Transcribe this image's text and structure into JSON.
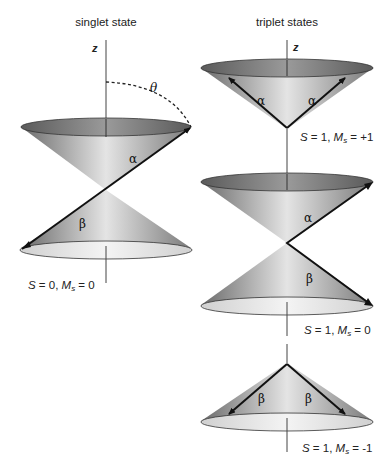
{
  "titles": {
    "singlet": "singlet state",
    "triplet": "triplet states"
  },
  "axis_label": "z",
  "angle_label": "θ",
  "spin_labels": {
    "alpha": "α",
    "beta": "β"
  },
  "states": [
    {
      "name": "singlet",
      "S": "S",
      "S_val": " = 0, ",
      "M": "M",
      "M_sub": "s",
      "M_val": " = 0"
    },
    {
      "name": "triplet-plus1",
      "S": "S",
      "S_val": " = 1, ",
      "M": "M",
      "M_sub": "s",
      "M_val": " = +1"
    },
    {
      "name": "triplet-0",
      "S": "S",
      "S_val": " = 1, ",
      "M": "M",
      "M_sub": "s",
      "M_val": " = 0"
    },
    {
      "name": "triplet-minus1",
      "S": "S",
      "S_val": " = 1, ",
      "M": "M",
      "M_sub": "s",
      "M_val": " = -1"
    }
  ],
  "colors": {
    "cone_dark": "#6e6e6e",
    "cone_light": "#e6e6e6",
    "ellipse_top": "#7a7a7a",
    "ellipse_bottom": "#e8e8e8",
    "vector": "#111111",
    "axis": "#333333"
  }
}
